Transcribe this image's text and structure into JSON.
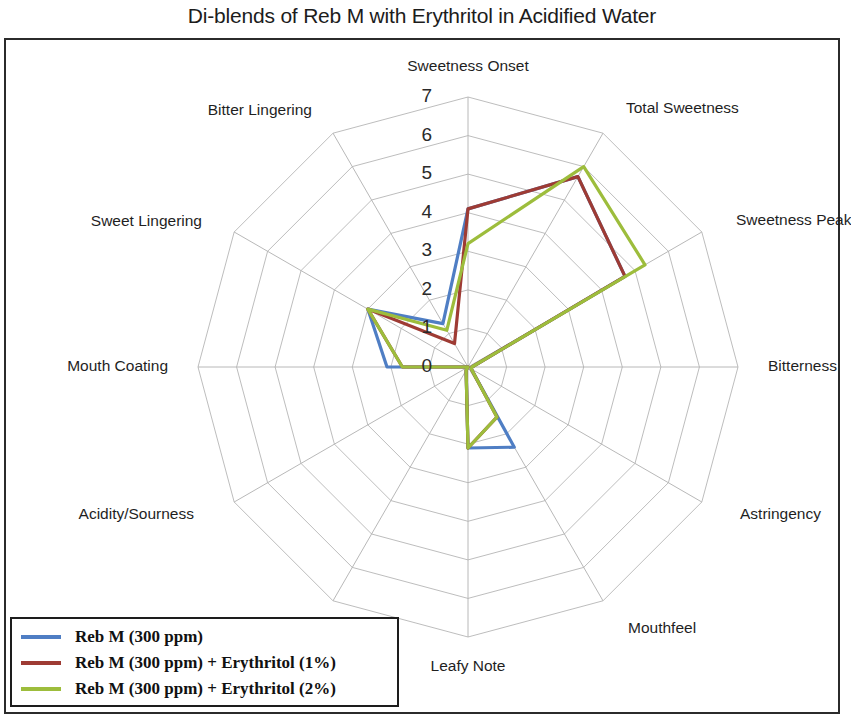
{
  "chart_title": "Di-blends of Reb M with Erythritol in Acidified Water",
  "legend": {
    "items": [
      {
        "label": "Reb M (300 ppm)",
        "color": "#4f7ec4"
      },
      {
        "label": "Reb M (300 ppm) + Erythritol  (1%)",
        "color": "#9e3b34"
      },
      {
        "label": "Reb M (300 ppm) + Erythritol  (2%)",
        "color": "#9dbd3c"
      }
    ]
  },
  "chart_data": {
    "type": "radar",
    "title": "Di-blends of Reb M with Erythritol in Acidified Water",
    "categories": [
      "Sweetness Onset",
      "Total Sweetness",
      "Sweetness Peak",
      "Bitterness",
      "Astringency",
      "Mouthfeel",
      "Leafy Note",
      "Licorice",
      "Acidity/Sourness",
      "Mouth Coating",
      "Sweet Lingering",
      "Bitter Lingering"
    ],
    "tick_labels": [
      "0",
      "1",
      "2",
      "3",
      "4",
      "5",
      "6",
      "7"
    ],
    "rlim": [
      0,
      7
    ],
    "rtick_step": 1,
    "grid": true,
    "legend_position": "bottom-left",
    "series": [
      {
        "name": "Reb M (300 ppm)",
        "color": "#4f7ec4",
        "values": [
          4.1,
          5.7,
          4.7,
          0.1,
          0.1,
          2.4,
          2.1,
          0.1,
          0.0,
          2.1,
          3.0,
          1.3
        ]
      },
      {
        "name": "Reb M (300 ppm) + Erythritol  (1%)",
        "color": "#9e3b34",
        "values": [
          4.1,
          5.7,
          4.7,
          0.1,
          0.1,
          1.5,
          2.1,
          0.1,
          0.0,
          1.7,
          3.0,
          0.7
        ]
      },
      {
        "name": "Reb M (300 ppm) + Erythritol  (2%)",
        "color": "#9dbd3c",
        "values": [
          3.2,
          6.0,
          5.3,
          0.1,
          0.1,
          1.5,
          2.1,
          0.1,
          0.0,
          1.7,
          3.0,
          1.1
        ]
      }
    ]
  },
  "geometry": {
    "center_x": 468,
    "center_y": 367,
    "radius": 270,
    "ring_label_x": 432,
    "axis_label_offsets": [
      {
        "dx": 0,
        "dy": -300,
        "align": "center"
      },
      {
        "dx": 158,
        "dy": -258,
        "align": "left"
      },
      {
        "dx": 268,
        "dy": -146,
        "align": "left"
      },
      {
        "dx": 300,
        "dy": 0,
        "align": "left"
      },
      {
        "dx": 272,
        "dy": 148,
        "align": "left"
      },
      {
        "dx": 160,
        "dy": 262,
        "align": "left"
      },
      {
        "dx": 0,
        "dy": 300,
        "align": "center"
      },
      {
        "dx": -162,
        "dy": 262,
        "align": "right"
      },
      {
        "dx": -274,
        "dy": 148,
        "align": "right"
      },
      {
        "dx": -300,
        "dy": 0,
        "align": "right"
      },
      {
        "dx": -266,
        "dy": -145,
        "align": "right"
      },
      {
        "dx": -156,
        "dy": -256,
        "align": "right"
      }
    ]
  }
}
